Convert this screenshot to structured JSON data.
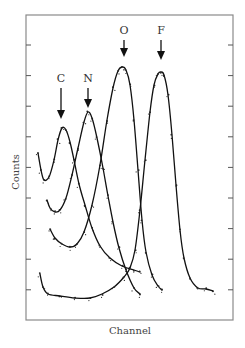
{
  "chart_data": {
    "type": "line",
    "title": "",
    "xlabel": "Channel",
    "ylabel": "Counts",
    "grid": false,
    "legend": null,
    "ticks": {
      "left": 9,
      "right": 9,
      "labels": "none"
    },
    "annotations": [
      {
        "label": "C",
        "x": 61,
        "label_y": 82,
        "arrow_to": 119
      },
      {
        "label": "N",
        "x": 88,
        "label_y": 82,
        "arrow_to": 108
      },
      {
        "label": "O",
        "x": 124,
        "label_y": 34,
        "arrow_to": 57
      },
      {
        "label": "F",
        "x": 161,
        "label_y": 34,
        "arrow_to": 60
      }
    ],
    "series": [
      {
        "name": "C",
        "points": [
          [
            38,
            153
          ],
          [
            41,
            170
          ],
          [
            44,
            180
          ],
          [
            49,
            177
          ],
          [
            54,
            160
          ],
          [
            58,
            140
          ],
          [
            62,
            128
          ],
          [
            66,
            130
          ],
          [
            70,
            142
          ],
          [
            74,
            160
          ],
          [
            79,
            184
          ],
          [
            85,
            205
          ],
          [
            92,
            228
          ],
          [
            100,
            246
          ],
          [
            110,
            258
          ],
          [
            122,
            266
          ],
          [
            134,
            270
          ],
          [
            140,
            272
          ]
        ]
      },
      {
        "name": "N",
        "points": [
          [
            47,
            200
          ],
          [
            50,
            208
          ],
          [
            55,
            212
          ],
          [
            60,
            210
          ],
          [
            66,
            198
          ],
          [
            72,
            175
          ],
          [
            78,
            148
          ],
          [
            84,
            122
          ],
          [
            88,
            112
          ],
          [
            92,
            118
          ],
          [
            97,
            138
          ],
          [
            103,
            168
          ],
          [
            108,
            196
          ],
          [
            113,
            222
          ],
          [
            119,
            248
          ],
          [
            126,
            270
          ],
          [
            134,
            288
          ],
          [
            140,
            294
          ]
        ]
      },
      {
        "name": "O",
        "points": [
          [
            50,
            229
          ],
          [
            55,
            238
          ],
          [
            62,
            244
          ],
          [
            70,
            247
          ],
          [
            77,
            244
          ],
          [
            84,
            232
          ],
          [
            92,
            205
          ],
          [
            100,
            165
          ],
          [
            107,
            120
          ],
          [
            113,
            88
          ],
          [
            118,
            71
          ],
          [
            122,
            67
          ],
          [
            126,
            70
          ],
          [
            130,
            85
          ],
          [
            134,
            120
          ],
          [
            138,
            170
          ],
          [
            142,
            220
          ],
          [
            146,
            252
          ],
          [
            152,
            275
          ],
          [
            158,
            286
          ],
          [
            162,
            290
          ]
        ]
      },
      {
        "name": "F",
        "points": [
          [
            40,
            274
          ],
          [
            43,
            287
          ],
          [
            48,
            294
          ],
          [
            60,
            296
          ],
          [
            75,
            298
          ],
          [
            90,
            298
          ],
          [
            102,
            294
          ],
          [
            114,
            287
          ],
          [
            124,
            277
          ],
          [
            130,
            268
          ],
          [
            135,
            250
          ],
          [
            140,
            210
          ],
          [
            145,
            160
          ],
          [
            150,
            112
          ],
          [
            154,
            85
          ],
          [
            158,
            74
          ],
          [
            161,
            72
          ],
          [
            164,
            75
          ],
          [
            168,
            95
          ],
          [
            172,
            135
          ],
          [
            176,
            185
          ],
          [
            180,
            230
          ],
          [
            184,
            258
          ],
          [
            190,
            278
          ],
          [
            198,
            288
          ],
          [
            206,
            289
          ],
          [
            213,
            291
          ]
        ]
      }
    ]
  }
}
